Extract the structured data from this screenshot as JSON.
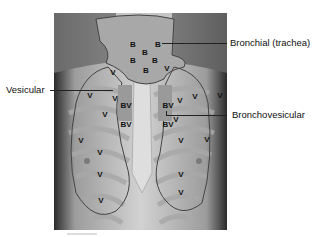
{
  "figure": {
    "labels": {
      "bronchial": "Bronchial (trachea)",
      "vesicular": "Vesicular",
      "bronchovesicular": "Bronchovesicular"
    },
    "zone_markers": {
      "B": "B",
      "BV": "BV",
      "V": "V"
    },
    "zones": [
      {
        "type": "B",
        "x": 79,
        "y": 32
      },
      {
        "type": "B",
        "x": 104,
        "y": 32
      },
      {
        "type": "B",
        "x": 91,
        "y": 40
      },
      {
        "type": "B",
        "x": 79,
        "y": 48
      },
      {
        "type": "B",
        "x": 101,
        "y": 48
      },
      {
        "type": "B",
        "x": 92,
        "y": 58
      },
      {
        "type": "V",
        "x": 59,
        "y": 60
      },
      {
        "type": "V",
        "x": 113,
        "y": 56
      },
      {
        "type": "V",
        "x": 36,
        "y": 83
      },
      {
        "type": "V",
        "x": 61,
        "y": 86
      },
      {
        "type": "V",
        "x": 141,
        "y": 84
      },
      {
        "type": "V",
        "x": 166,
        "y": 83
      },
      {
        "type": "V",
        "x": 51,
        "y": 102
      },
      {
        "type": "V",
        "x": 126,
        "y": 88
      },
      {
        "type": "V",
        "x": 122,
        "y": 107
      },
      {
        "type": "V",
        "x": 27,
        "y": 128
      },
      {
        "type": "V",
        "x": 127,
        "y": 128
      },
      {
        "type": "V",
        "x": 46,
        "y": 140
      },
      {
        "type": "V",
        "x": 46,
        "y": 162
      },
      {
        "type": "V",
        "x": 127,
        "y": 162
      },
      {
        "type": "V",
        "x": 153,
        "y": 127
      },
      {
        "type": "V",
        "x": 47,
        "y": 188
      },
      {
        "type": "V",
        "x": 127,
        "y": 180
      }
    ],
    "bv_zones": [
      {
        "x": 72,
        "y": 93
      },
      {
        "x": 114,
        "y": 93
      },
      {
        "x": 72,
        "y": 112
      },
      {
        "x": 114,
        "y": 112
      }
    ],
    "colors": {
      "background": "#ffffff",
      "photo_dark": "#5a5a5a",
      "skin": "#bdbdbd",
      "overlay": "#9a9a9a",
      "outline": "#444444",
      "text": "#111111"
    }
  }
}
